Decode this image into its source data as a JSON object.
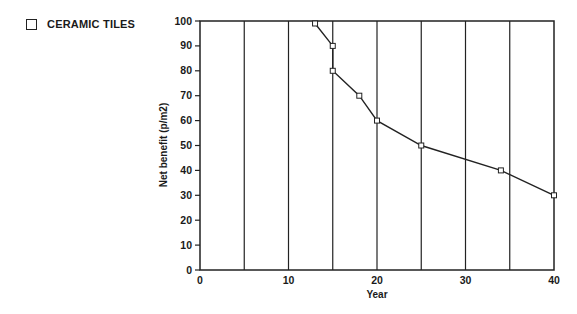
{
  "chart_data": {
    "type": "line",
    "title": "",
    "xlabel": "Year",
    "ylabel": "Net benefit (p/m2)",
    "xlim": [
      0,
      40
    ],
    "ylim": [
      0,
      100
    ],
    "x_ticks": [
      0,
      10,
      20,
      30,
      40
    ],
    "y_ticks": [
      0,
      10,
      20,
      30,
      40,
      50,
      60,
      70,
      80,
      90,
      100
    ],
    "vertical_gridlines": [
      5,
      10,
      15,
      20,
      25,
      30,
      35
    ],
    "grid": "vertical lines only",
    "legend": {
      "position": "top-left, outside plot",
      "entries": [
        "CERAMIC TILES"
      ]
    },
    "series": [
      {
        "name": "CERAMIC TILES",
        "marker": "open-square",
        "x": [
          13,
          15,
          15,
          18,
          20,
          25,
          34,
          40
        ],
        "y": [
          99,
          90,
          80,
          70,
          60,
          50,
          40,
          30
        ]
      }
    ]
  },
  "legend": {
    "label": "CERAMIC TILES"
  },
  "colors": {
    "line": "#222222",
    "marker_fill": "#ffffff",
    "background": "#ffffff"
  }
}
